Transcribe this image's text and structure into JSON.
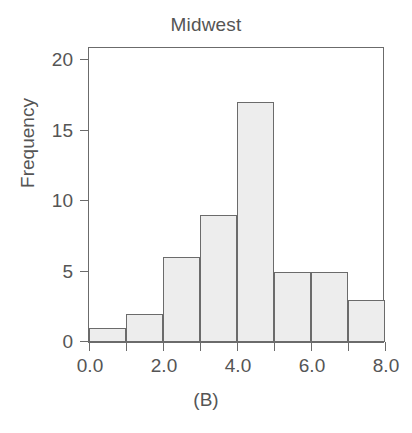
{
  "chart_data": {
    "type": "bar",
    "title": "Midwest",
    "xlabel": "",
    "ylabel": "Frequency",
    "caption": "(B)",
    "categories": [
      "0-1",
      "1-2",
      "2-3",
      "3-4",
      "4-5",
      "5-6",
      "6-7",
      "7-8"
    ],
    "bin_edges": [
      0,
      1,
      2,
      3,
      4,
      5,
      6,
      7,
      8
    ],
    "values": [
      1,
      2,
      6,
      9,
      17,
      5,
      5,
      3
    ],
    "xlim": [
      0.0,
      8.0
    ],
    "ylim": [
      0,
      21
    ],
    "x_ticks": [
      0.0,
      1.0,
      2.0,
      3.0,
      4.0,
      5.0,
      6.0,
      7.0,
      8.0
    ],
    "x_tick_labels": [
      "0.0",
      "",
      "2.0",
      "",
      "4.0",
      "",
      "6.0",
      "",
      "8.0"
    ],
    "y_ticks": [
      0,
      5,
      10,
      15,
      20
    ],
    "y_tick_labels": [
      "0",
      "5",
      "10",
      "15",
      "20"
    ],
    "grid": false,
    "legend": null,
    "bar_fill_color": "#ededed",
    "bar_border_color": "#6b6b6b",
    "axis_color": "#6b6b6b",
    "text_color": "#555555",
    "background_color": "#ffffff"
  }
}
